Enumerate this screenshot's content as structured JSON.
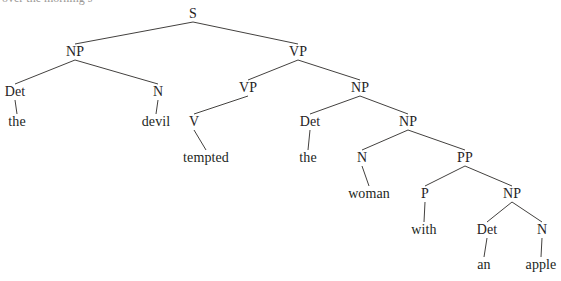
{
  "figure": {
    "type": "constituency-syntax-tree",
    "sentence": "the devil tempted the woman with an apple",
    "background_color": "#ffffff",
    "line_color": "#43413f",
    "text_color": "#26231f",
    "cropped_caption_text": "over the morning s"
  },
  "nodes": [
    {
      "id": "s",
      "label": "S",
      "kind": "nonterminal",
      "x": 193,
      "y": 14
    },
    {
      "id": "np1",
      "label": "NP",
      "kind": "nonterminal",
      "x": 75,
      "y": 52
    },
    {
      "id": "vp1",
      "label": "VP",
      "kind": "nonterminal",
      "x": 298,
      "y": 52
    },
    {
      "id": "det1",
      "label": "Det",
      "kind": "preterminal",
      "x": 15,
      "y": 92
    },
    {
      "id": "n1",
      "label": "N",
      "kind": "preterminal",
      "x": 158,
      "y": 92
    },
    {
      "id": "vp2",
      "label": "VP",
      "kind": "nonterminal",
      "x": 248,
      "y": 88
    },
    {
      "id": "np2",
      "label": "NP",
      "kind": "nonterminal",
      "x": 360,
      "y": 88
    },
    {
      "id": "the1",
      "label": "the",
      "kind": "terminal",
      "x": 17,
      "y": 122
    },
    {
      "id": "devil",
      "label": "devil",
      "kind": "terminal",
      "x": 156,
      "y": 122
    },
    {
      "id": "v1",
      "label": "V",
      "kind": "preterminal",
      "x": 194,
      "y": 122
    },
    {
      "id": "det2",
      "label": "Det",
      "kind": "preterminal",
      "x": 310,
      "y": 122
    },
    {
      "id": "np3",
      "label": "NP",
      "kind": "nonterminal",
      "x": 408,
      "y": 122
    },
    {
      "id": "tempted",
      "label": "tempted",
      "kind": "terminal",
      "x": 206,
      "y": 158
    },
    {
      "id": "the2",
      "label": "the",
      "kind": "terminal",
      "x": 308,
      "y": 158
    },
    {
      "id": "n2",
      "label": "N",
      "kind": "preterminal",
      "x": 362,
      "y": 158
    },
    {
      "id": "pp1",
      "label": "PP",
      "kind": "nonterminal",
      "x": 465,
      "y": 158
    },
    {
      "id": "woman",
      "label": "woman",
      "kind": "terminal",
      "x": 369,
      "y": 194
    },
    {
      "id": "p1",
      "label": "P",
      "kind": "preterminal",
      "x": 425,
      "y": 194
    },
    {
      "id": "np4",
      "label": "NP",
      "kind": "nonterminal",
      "x": 512,
      "y": 194
    },
    {
      "id": "with",
      "label": "with",
      "kind": "terminal",
      "x": 424,
      "y": 230
    },
    {
      "id": "det3",
      "label": "Det",
      "kind": "preterminal",
      "x": 487,
      "y": 230
    },
    {
      "id": "n3",
      "label": "N",
      "kind": "preterminal",
      "x": 542,
      "y": 230
    },
    {
      "id": "an",
      "label": "an",
      "kind": "terminal",
      "x": 484,
      "y": 265
    },
    {
      "id": "apple",
      "label": "apple",
      "kind": "terminal",
      "x": 541,
      "y": 265
    }
  ],
  "edges": [
    {
      "from": "s",
      "to": "np1"
    },
    {
      "from": "s",
      "to": "vp1"
    },
    {
      "from": "np1",
      "to": "det1"
    },
    {
      "from": "np1",
      "to": "n1"
    },
    {
      "from": "vp1",
      "to": "vp2"
    },
    {
      "from": "vp1",
      "to": "np2"
    },
    {
      "from": "det1",
      "to": "the1"
    },
    {
      "from": "n1",
      "to": "devil"
    },
    {
      "from": "vp2",
      "to": "v1"
    },
    {
      "from": "np2",
      "to": "det2"
    },
    {
      "from": "np2",
      "to": "np3"
    },
    {
      "from": "v1",
      "to": "tempted"
    },
    {
      "from": "det2",
      "to": "the2"
    },
    {
      "from": "np3",
      "to": "n2"
    },
    {
      "from": "np3",
      "to": "pp1"
    },
    {
      "from": "n2",
      "to": "woman"
    },
    {
      "from": "pp1",
      "to": "p1"
    },
    {
      "from": "pp1",
      "to": "np4"
    },
    {
      "from": "p1",
      "to": "with"
    },
    {
      "from": "np4",
      "to": "det3"
    },
    {
      "from": "np4",
      "to": "n3"
    },
    {
      "from": "det3",
      "to": "an"
    },
    {
      "from": "n3",
      "to": "apple"
    }
  ]
}
